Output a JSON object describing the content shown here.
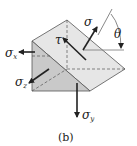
{
  "figure": {
    "caption": "(b)",
    "labels": {
      "sigma": "σ",
      "tau": "τ",
      "theta": "θ",
      "sigma_x": {
        "base": "σ",
        "sub": "x"
      },
      "sigma_y": {
        "base": "σ",
        "sub": "y"
      },
      "sigma_z": {
        "base": "σ",
        "sub": "z"
      }
    },
    "colors": {
      "front_face": "#c9c9c9",
      "slope_face": "#e6e6e6",
      "edge": "#555555",
      "arrow": "#222222"
    }
  }
}
